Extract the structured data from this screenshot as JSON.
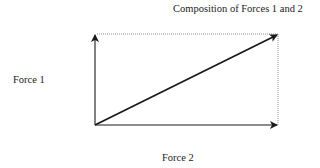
{
  "diagram": {
    "title": "Composition of Forces 1 and 2",
    "labels": {
      "force1": "Force 1",
      "force2": "Force 2",
      "resultant": "Composition of Forces 1 and 2"
    },
    "geometry": {
      "origin": [
        95,
        125
      ],
      "force1_tip": [
        95,
        34
      ],
      "force2_tip": [
        278,
        125
      ],
      "resultant_tip": [
        278,
        34
      ]
    },
    "colors": {
      "stroke": "#1a1a1a",
      "dotted": "#777777",
      "text": "#222222"
    }
  }
}
